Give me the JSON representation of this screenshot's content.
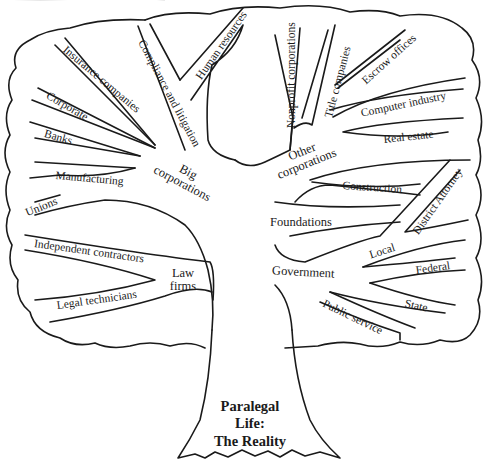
{
  "diagram": {
    "type": "tree",
    "title": [
      "Paralegal",
      "Life:",
      "The Reality"
    ],
    "hubs": {
      "big_corporations": "Big corporations",
      "other_corporations": "Other corporations",
      "law_firms": "Law firms",
      "foundations": "Foundations",
      "government": "Government"
    },
    "branches": {
      "big_corporations": [
        "Compliance and litigation",
        "Human resources",
        "Insurance companies",
        "Corporate",
        "Banks",
        "Manufacturing",
        "Unions"
      ],
      "other_corporations": [
        "Nonprofit corporations",
        "Title companies",
        "Escrow offices",
        "Computer industry",
        "Real estate",
        "Construction"
      ],
      "law_firms": [
        "Independent contractors",
        "Legal technicians"
      ],
      "government": [
        "District Attorney",
        "Local",
        "Federal",
        "State",
        "Public service"
      ]
    },
    "colors": {
      "ink": "#1a1a1a",
      "background": "#ffffff"
    }
  }
}
